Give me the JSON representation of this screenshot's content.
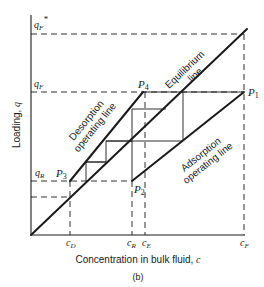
{
  "figure": {
    "caption": "(b)",
    "xlabel": "Concentration in bulk fluid, ",
    "xlabel_var": "c",
    "ylabel": "Loading, ",
    "ylabel_var": "q"
  },
  "y_ticks": {
    "qF_star": "q",
    "qF_star_sub": "F",
    "qF_star_sup": "*",
    "qF": "q",
    "qF_sub": "F",
    "qR": "q",
    "qR_sub": "R"
  },
  "x_ticks": {
    "cD": "c",
    "cD_sub": "D",
    "cR": "c",
    "cR_sub": "R",
    "cE": "c",
    "cE_sub": "E",
    "cF": "c",
    "cF_sub": "F"
  },
  "points": {
    "P1": "P",
    "P1_sub": "1",
    "P2": "P",
    "P2_sub": "2",
    "P3": "P",
    "P3_sub": "3",
    "P4": "P",
    "P4_sub": "4"
  },
  "lines": {
    "equilibrium_1": "Equilibrium",
    "equilibrium_2": "line",
    "desorption_1": "Desorption",
    "desorption_2": "operating line",
    "adsorption_1": "Adsorption",
    "adsorption_2": "operating line"
  },
  "colors": {
    "ink": "#1a1a1a",
    "background": "#ffffff"
  }
}
